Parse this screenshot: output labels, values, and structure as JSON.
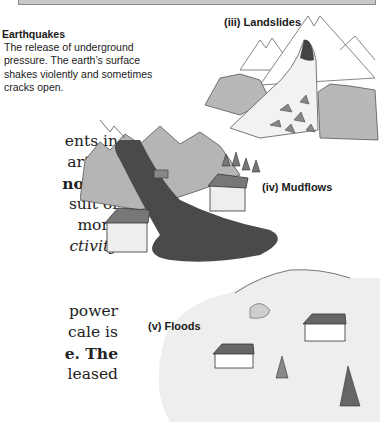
{
  "earthquakes": {
    "title": "Earthquakes",
    "lines": [
      "The release of underground",
      "pressure. The earth’s surface",
      "shakes violently and sometimes",
      "cracks open."
    ]
  },
  "body_text_fragment_1": [
    "ents in",
    "arth is",
    "nolten",
    "sult of",
    "more",
    "ctivity"
  ],
  "body_text_fragment_2": [
    "power",
    "cale is",
    "e. The",
    "leased"
  ],
  "illustrations": {
    "landslides_label": "(iii)  Landslides",
    "mudflows_label": "(iv)  Mudflows",
    "floods_label": "(v)  Floods"
  },
  "colors": {
    "hill_gray": "#b5b5b5",
    "mud_dark": "#4a4a4a",
    "water_light": "#eeeeee",
    "line": "#555555"
  }
}
